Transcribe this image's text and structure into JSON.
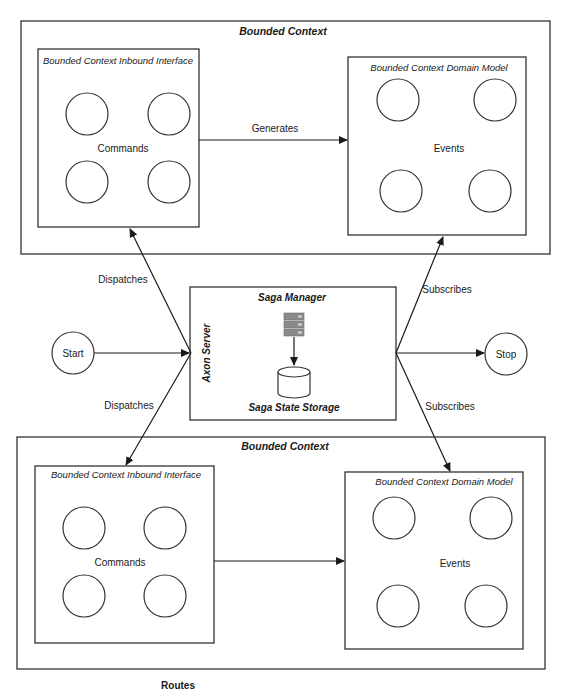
{
  "diagram": {
    "top_context": {
      "title": "Bounded Context",
      "inbound": {
        "title": "Bounded Context Inbound Interface",
        "label": "Commands"
      },
      "domain": {
        "title": "Bounded Context Domain Model",
        "label": "Events"
      },
      "edge_label": "Generates"
    },
    "bottom_context": {
      "title": "Bounded Context",
      "inbound": {
        "title": "Bounded Context Inbound Interface",
        "label": "Commands"
      },
      "domain": {
        "title": "Bounded Context Domain Model",
        "label": "Events"
      }
    },
    "axon": {
      "side_label": "Axon Server",
      "title": "Saga Manager",
      "storage_label": "Saga State Storage",
      "icons": [
        "server-stack-icon",
        "database-cylinder-icon"
      ]
    },
    "start": {
      "label": "Start"
    },
    "stop": {
      "label": "Stop"
    },
    "edges": {
      "dispatches_top": "Dispatches",
      "dispatches_bottom": "Dispatches",
      "subscribes_top": "Subscribes",
      "subscribes_bottom": "Subscribes"
    },
    "caption": "Routes",
    "colors": {
      "stroke": "#333333",
      "text": "#1a1a1a",
      "server_icon": "#8a8a8a"
    }
  }
}
